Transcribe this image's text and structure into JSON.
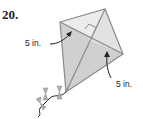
{
  "problem_number": "20.",
  "figure": {
    "shape": "kite",
    "labels": [
      {
        "id": "left-diagonal-half",
        "text": "5 in."
      },
      {
        "id": "right-diagonal-half",
        "text": "5 in."
      }
    ],
    "right_angle_marker": true,
    "colors": {
      "fill_light": "#ececec",
      "fill_dark": "#cfcfcf",
      "stroke": "#8a8a8a",
      "bow": "#aaaaaa"
    }
  }
}
